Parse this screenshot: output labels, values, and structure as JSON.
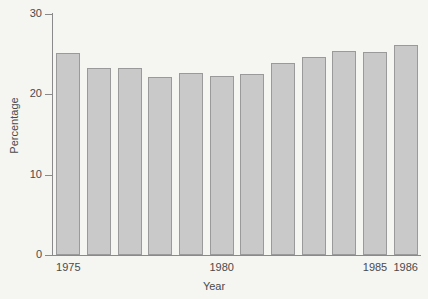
{
  "chart_data": {
    "type": "bar",
    "title": "",
    "xlabel": "Year",
    "ylabel": "Percentage",
    "categories": [
      "1975",
      "1976",
      "1977",
      "1978",
      "1979",
      "1980",
      "1981",
      "1982",
      "1983",
      "1984",
      "1985",
      "1986"
    ],
    "values": [
      25.2,
      23.3,
      23.3,
      22.1,
      22.6,
      22.3,
      22.5,
      23.9,
      24.7,
      25.4,
      25.3,
      26.1
    ],
    "ylim": [
      0,
      30
    ],
    "yticks": [
      0,
      10,
      20,
      30
    ],
    "ytick_labels": [
      "0",
      "10",
      "20",
      "30"
    ],
    "xtick_labels": [
      "1975",
      "1980",
      "1985",
      "1986"
    ],
    "xtick_categories": [
      "1975",
      "1980",
      "1985",
      "1986"
    ],
    "grid": false,
    "legend": "none",
    "bar_color": "#c9c9c9",
    "bar_edge_color": "#9a9a9a",
    "axis_color": "#8a8a8a",
    "background_color": "#f5f5f2",
    "text_color": "#4a4a4a"
  }
}
